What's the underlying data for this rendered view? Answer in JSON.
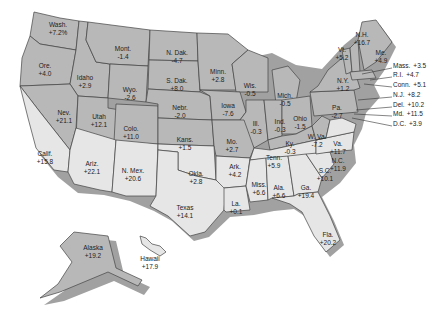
{
  "map": {
    "type": "choropleth",
    "subject": "US states percent change",
    "colors": {
      "dark_shade": "#b4b4b4",
      "light_shade": "#e6e6e6",
      "border": "#444444",
      "shadow": "#7a7a7a",
      "background": "#ffffff"
    },
    "states": [
      {
        "name": "Wash.",
        "value": "+7.2%",
        "shade": "dark",
        "x": 58,
        "y": 21
      },
      {
        "name": "Ore.",
        "value": "+4.0",
        "shade": "dark",
        "x": 45,
        "y": 62
      },
      {
        "name": "Idaho",
        "value": "+2.9",
        "shade": "dark",
        "x": 85,
        "y": 74
      },
      {
        "name": "Mont.",
        "value": "-1.4",
        "shade": "dark",
        "x": 123,
        "y": 45
      },
      {
        "name": "Wyo.",
        "value": "-2.6",
        "shade": "dark",
        "x": 130,
        "y": 86
      },
      {
        "name": "N. Dak.",
        "value": "-4.7",
        "shade": "dark",
        "x": 177,
        "y": 49
      },
      {
        "name": "S. Dak.",
        "value": "+8.0",
        "shade": "dark",
        "x": 177,
        "y": 77
      },
      {
        "name": "Minn.",
        "value": "+2.8",
        "shade": "dark",
        "x": 218,
        "y": 68
      },
      {
        "name": "Wis.",
        "value": "-0.5",
        "shade": "dark",
        "x": 250,
        "y": 82
      },
      {
        "name": "Mich.",
        "value": "-0.5",
        "shade": "dark",
        "x": 285,
        "y": 92
      },
      {
        "name": "Nev.",
        "value": "+21.1",
        "shade": "dark",
        "x": 64,
        "y": 109
      },
      {
        "name": "Utah",
        "value": "+12.1",
        "shade": "dark",
        "x": 99,
        "y": 113
      },
      {
        "name": "Colo.",
        "value": "+11.0",
        "shade": "dark",
        "x": 131,
        "y": 125
      },
      {
        "name": "Nebr.",
        "value": "-2.0",
        "shade": "dark",
        "x": 180,
        "y": 104
      },
      {
        "name": "Iowa",
        "value": "-7.6",
        "shade": "dark",
        "x": 228,
        "y": 102
      },
      {
        "name": "Ill.",
        "value": "-0.3",
        "shade": "dark",
        "x": 256,
        "y": 120
      },
      {
        "name": "Ind.",
        "value": "-0.3",
        "shade": "dark",
        "x": 280,
        "y": 118
      },
      {
        "name": "Ohio",
        "value": "-1.5",
        "shade": "dark",
        "x": 300,
        "y": 115
      },
      {
        "name": "Pa.",
        "value": "-2.7",
        "shade": "dark",
        "x": 337,
        "y": 104
      },
      {
        "name": "N.Y.",
        "value": "+1.2",
        "shade": "dark",
        "x": 343,
        "y": 77
      },
      {
        "name": "Vt.",
        "value": "+5.2",
        "shade": "dark",
        "x": 342,
        "y": 46
      },
      {
        "name": "N.H.",
        "value": "+16.7",
        "shade": "dark",
        "x": 362,
        "y": 31
      },
      {
        "name": "Me.",
        "value": "+4.9",
        "shade": "dark",
        "x": 381,
        "y": 49
      },
      {
        "name": "Kans.",
        "value": "+1.5",
        "shade": "dark",
        "x": 185,
        "y": 136
      },
      {
        "name": "Mo.",
        "value": "+2.7",
        "shade": "dark",
        "x": 232,
        "y": 138
      },
      {
        "name": "Ky.",
        "value": "-0.3",
        "shade": "dark",
        "x": 290,
        "y": 140
      },
      {
        "name": "W. Va.",
        "value": "-7.2",
        "shade": "dark",
        "x": 317,
        "y": 133
      },
      {
        "name": "Va.",
        "value": "+11.7",
        "shade": "light",
        "x": 338,
        "y": 140
      },
      {
        "name": "Calif.",
        "value": "+15.8",
        "shade": "light",
        "x": 45,
        "y": 150
      },
      {
        "name": "Ariz.",
        "value": "+22.1",
        "shade": "light",
        "x": 92,
        "y": 160
      },
      {
        "name": "N. Mex.",
        "value": "+20.6",
        "shade": "light",
        "x": 133,
        "y": 167
      },
      {
        "name": "Okla.",
        "value": "+2.8",
        "shade": "light",
        "x": 196,
        "y": 170
      },
      {
        "name": "Texas",
        "value": "+14.1",
        "shade": "light",
        "x": 185,
        "y": 204
      },
      {
        "name": "Ark.",
        "value": "+4.2",
        "shade": "light",
        "x": 235,
        "y": 163
      },
      {
        "name": "La.",
        "value": "+0.1",
        "shade": "light",
        "x": 236,
        "y": 200
      },
      {
        "name": "Tenn.",
        "value": "+5.9",
        "shade": "light",
        "x": 274,
        "y": 154
      },
      {
        "name": "Miss.",
        "value": "+6.6",
        "shade": "light",
        "x": 259,
        "y": 181
      },
      {
        "name": "Ala.",
        "value": "+6.6",
        "shade": "light",
        "x": 279,
        "y": 184
      },
      {
        "name": "Ga.",
        "value": "+19.4",
        "shade": "light",
        "x": 306,
        "y": 184
      },
      {
        "name": "S.C.",
        "value": "+10.1",
        "shade": "light",
        "x": 325,
        "y": 167
      },
      {
        "name": "N.C.",
        "value": "+11.9",
        "shade": "light",
        "x": 338,
        "y": 157
      },
      {
        "name": "Fla.",
        "value": "+20.2",
        "shade": "light",
        "x": 328,
        "y": 231
      },
      {
        "name": "Alaska",
        "value": "+19.2",
        "shade": "dark",
        "x": 93,
        "y": 244
      },
      {
        "name": "Hawaii",
        "value": "+17.9",
        "shade": "light",
        "x": 150,
        "y": 255
      }
    ],
    "callouts": [
      {
        "name": "Mass.",
        "value": "+3.5",
        "x": 393,
        "y": 66
      },
      {
        "name": "R.I.",
        "value": "+4.7",
        "x": 393,
        "y": 75
      },
      {
        "name": "Conn.",
        "value": "+5.1",
        "x": 393,
        "y": 85
      },
      {
        "name": "N.J.",
        "value": "+8.2",
        "x": 393,
        "y": 95
      },
      {
        "name": "Del.",
        "value": "+10.2",
        "x": 393,
        "y": 105
      },
      {
        "name": "Md.",
        "value": "+11.5",
        "x": 393,
        "y": 114
      },
      {
        "name": "D.C.",
        "value": "+3.9",
        "x": 393,
        "y": 124
      }
    ]
  }
}
